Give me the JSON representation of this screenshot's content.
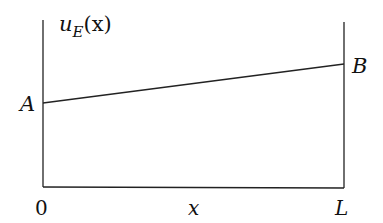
{
  "diagram": {
    "y_axis_label": "u",
    "y_axis_label_sub": "E",
    "y_axis_label_arg": "(x)",
    "x_axis_label": "x",
    "x_start_label": "0",
    "x_end_label": "L",
    "point_a_label": "A",
    "point_b_label": "B",
    "colors": {
      "line": "#222222",
      "background": "#ffffff"
    }
  }
}
